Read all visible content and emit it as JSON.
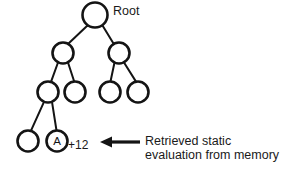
{
  "figure": {
    "type": "game-search-tree-diagram",
    "width": 285,
    "height": 173,
    "background_color": "#ffffff",
    "stroke_color": "#141414",
    "text_color": "#1a1a1a",
    "node_stroke_width": 2.6,
    "edge_stroke_width": 2.0
  },
  "labels": {
    "root": "Root",
    "node_a": "A",
    "value": "+12",
    "annotation_line1": "Retrieved static",
    "annotation_line2": "evaluation from memory"
  },
  "nodes": [
    {
      "id": "root",
      "cx": 95,
      "cy": 15,
      "r": 12.5,
      "label": "",
      "level": 0
    },
    {
      "id": "n1",
      "cx": 63,
      "cy": 53,
      "r": 10.5,
      "label": "",
      "level": 1
    },
    {
      "id": "n2",
      "cx": 119,
      "cy": 53,
      "r": 10.5,
      "label": "",
      "level": 1
    },
    {
      "id": "n3",
      "cx": 48,
      "cy": 92,
      "r": 10.5,
      "label": "",
      "level": 2
    },
    {
      "id": "n4",
      "cx": 75,
      "cy": 92,
      "r": 10.5,
      "label": "",
      "level": 2
    },
    {
      "id": "n5",
      "cx": 110,
      "cy": 92,
      "r": 10.5,
      "label": "",
      "level": 2
    },
    {
      "id": "n6",
      "cx": 138,
      "cy": 92,
      "r": 10.5,
      "label": "",
      "level": 2
    },
    {
      "id": "n7",
      "cx": 28,
      "cy": 141,
      "r": 10.5,
      "label": "",
      "level": 3
    },
    {
      "id": "nA",
      "cx": 57,
      "cy": 141,
      "r": 10.5,
      "label": "A",
      "level": 3
    }
  ],
  "edges": [
    {
      "from": "root",
      "to": "n1"
    },
    {
      "from": "root",
      "to": "n2"
    },
    {
      "from": "n1",
      "to": "n3"
    },
    {
      "from": "n1",
      "to": "n4"
    },
    {
      "from": "n2",
      "to": "n5"
    },
    {
      "from": "n2",
      "to": "n6"
    },
    {
      "from": "n3",
      "to": "n7"
    },
    {
      "from": "n3",
      "to": "nA"
    }
  ],
  "arrow": {
    "name": "annotation-arrow",
    "points_to": "left",
    "x_tip": 100,
    "x_tail": 140,
    "y": 142
  }
}
